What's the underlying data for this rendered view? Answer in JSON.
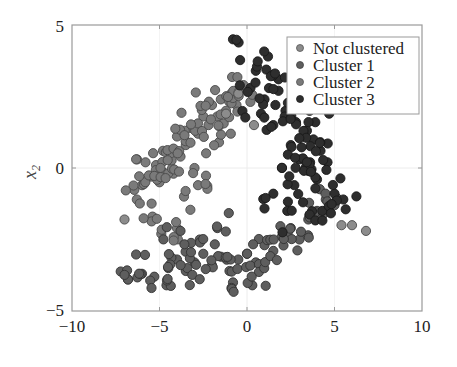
{
  "chart_data": {
    "type": "scatter",
    "title": "",
    "xlabel": "",
    "ylabel": "x2",
    "ylabel_main": "x",
    "ylabel_sub": "2",
    "xlim": [
      -10,
      10
    ],
    "ylim": [
      -5,
      5
    ],
    "xticks": [
      -10,
      -5,
      0,
      5,
      10
    ],
    "yticks": [
      -5,
      0,
      5
    ],
    "xtick_labels": [
      "−10",
      "−5",
      "0",
      "5",
      "10"
    ],
    "ytick_labels": [
      "−5",
      "0",
      "5"
    ],
    "grid": true,
    "legend_position": "upper right",
    "series": [
      {
        "name": "Not clustered",
        "color": "#8c8c8c",
        "points": [
          [
            -7.0,
            -1.8
          ],
          [
            5.4,
            -2.0
          ],
          [
            6.0,
            -2.0
          ],
          [
            6.8,
            -2.2
          ],
          [
            -6.8,
            -3.9
          ],
          [
            -0.5,
            2.6
          ],
          [
            2.4,
            2.3
          ],
          [
            -1.2,
            1.9
          ],
          [
            0.4,
            1.5
          ]
        ]
      },
      {
        "name": "Cluster 1",
        "color": "#5e5e5e",
        "region": "lower arc, from about (-6.5,-4) rising to (4.5,-0.8); centered near (-0.5,-3.2)",
        "points": [
          [
            -6.8,
            -3.9
          ],
          [
            -6.0,
            -3.7
          ],
          [
            -5.3,
            -3.8
          ],
          [
            -4.5,
            -3.5
          ],
          [
            -4.0,
            -3.2
          ],
          [
            -3.5,
            -3.6
          ],
          [
            -3.0,
            -3.3
          ],
          [
            -2.5,
            -3.0
          ],
          [
            -2.0,
            -3.4
          ],
          [
            -1.5,
            -3.1
          ],
          [
            -1.0,
            -3.6
          ],
          [
            -0.5,
            -3.2
          ],
          [
            0.0,
            -3.0
          ],
          [
            0.5,
            -3.3
          ],
          [
            1.0,
            -2.7
          ],
          [
            1.5,
            -2.9
          ],
          [
            2.0,
            -2.4
          ],
          [
            2.5,
            -2.1
          ],
          [
            3.0,
            -2.5
          ],
          [
            3.5,
            -1.8
          ],
          [
            4.0,
            -1.5
          ],
          [
            4.5,
            -1.1
          ],
          [
            5.0,
            -1.3
          ],
          [
            -3.8,
            -2.2
          ],
          [
            -2.7,
            -2.5
          ],
          [
            -1.7,
            -2.1
          ],
          [
            -0.8,
            -4.0
          ],
          [
            0.3,
            -4.1
          ],
          [
            -4.6,
            -4.1
          ]
        ]
      },
      {
        "name": "Cluster 2",
        "color": "#7a7a7a",
        "region": "upper-left arc, from about (-6,-1.2) rising to (0,3); centered near (-3.5,0.2)",
        "points": [
          [
            -6.3,
            -1.1
          ],
          [
            -6.0,
            -0.6
          ],
          [
            -5.8,
            0.2
          ],
          [
            -5.5,
            -0.3
          ],
          [
            -5.2,
            0.1
          ],
          [
            -5.0,
            -0.5
          ],
          [
            -4.8,
            0.6
          ],
          [
            -4.5,
            0.3
          ],
          [
            -4.2,
            -0.2
          ],
          [
            -4.0,
            1.1
          ],
          [
            -3.8,
            0.4
          ],
          [
            -3.5,
            0.8
          ],
          [
            -3.2,
            1.4
          ],
          [
            -3.0,
            0.0
          ],
          [
            -2.8,
            1.2
          ],
          [
            -2.5,
            1.8
          ],
          [
            -2.2,
            1.5
          ],
          [
            -2.0,
            2.2
          ],
          [
            -1.7,
            1.8
          ],
          [
            -1.5,
            2.4
          ],
          [
            -1.2,
            2.0
          ],
          [
            -0.9,
            2.6
          ],
          [
            -0.6,
            2.2
          ],
          [
            -0.2,
            2.9
          ],
          [
            -3.6,
            -1.0
          ],
          [
            -5.4,
            -1.7
          ],
          [
            -4.9,
            -2.3
          ],
          [
            -4.0,
            -2.1
          ],
          [
            -2.8,
            -0.6
          ],
          [
            -1.6,
            0.9
          ]
        ]
      },
      {
        "name": "Cluster 3",
        "color": "#2e2e2e",
        "region": "right arc, from about (-0.8,4.5) curving down to (3.5,-2); centered near (3,0.5)",
        "points": [
          [
            -0.8,
            4.5
          ],
          [
            1.2,
            3.9
          ],
          [
            0.5,
            3.4
          ],
          [
            1.8,
            3.1
          ],
          [
            0.2,
            2.8
          ],
          [
            1.0,
            2.4
          ],
          [
            2.2,
            2.0
          ],
          [
            2.8,
            1.6
          ],
          [
            1.5,
            1.5
          ],
          [
            3.3,
            1.3
          ],
          [
            3.8,
            1.0
          ],
          [
            2.5,
            0.8
          ],
          [
            4.2,
            0.6
          ],
          [
            3.0,
            0.3
          ],
          [
            4.6,
            0.2
          ],
          [
            2.0,
            0.0
          ],
          [
            3.5,
            -0.1
          ],
          [
            4.0,
            -0.4
          ],
          [
            2.7,
            -0.6
          ],
          [
            5.0,
            -0.9
          ],
          [
            1.5,
            -0.9
          ],
          [
            3.2,
            -1.2
          ],
          [
            2.3,
            -1.5
          ],
          [
            4.3,
            -1.5
          ],
          [
            5.5,
            -1.1
          ],
          [
            1.8,
            2.7
          ],
          [
            0.8,
            1.9
          ],
          [
            3.9,
            1.6
          ]
        ]
      }
    ]
  },
  "legend": {
    "items": [
      {
        "label": "Not clustered",
        "color": "#8c8c8c"
      },
      {
        "label": "Cluster 1",
        "color": "#5e5e5e"
      },
      {
        "label": "Cluster 2",
        "color": "#7a7a7a"
      },
      {
        "label": "Cluster 3",
        "color": "#2e2e2e"
      }
    ]
  }
}
